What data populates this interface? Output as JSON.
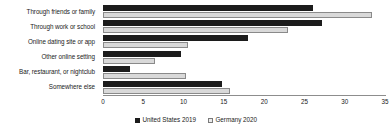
{
  "chart_data": {
    "type": "bar",
    "orientation": "horizontal",
    "title": "",
    "xlabel": "",
    "ylabel": "",
    "xlim": [
      0,
      35
    ],
    "xticks": [
      0,
      5,
      10,
      15,
      20,
      25,
      30,
      35
    ],
    "xtick_labels": [
      "0",
      "5",
      "10",
      "15",
      "20",
      "25",
      "30",
      "35"
    ],
    "grid": false,
    "legend_position": "bottom-center",
    "categories": [
      "Through friends or family",
      "Through work or school",
      "Online dating site or app",
      "Other online setting",
      "Bar, restaurant, or nightclub",
      "Somewhere else"
    ],
    "series": [
      {
        "name": "United States 2019",
        "color": "#1c1c1c",
        "values": [
          26.1,
          27.2,
          18.0,
          9.7,
          3.3,
          14.8
        ]
      },
      {
        "name": "Germany 2020",
        "color": "#d9d9d9",
        "values": [
          33.4,
          22.9,
          10.5,
          6.5,
          10.3,
          15.8
        ]
      }
    ]
  },
  "legend": {
    "entries": [
      {
        "label": "United States 2019",
        "swatch": "filled-black-square"
      },
      {
        "label": "Germany  2020",
        "swatch": "open-light-square"
      }
    ]
  },
  "axis": {
    "x_tick_labels": [
      "0",
      "5",
      "10",
      "15",
      "20",
      "25",
      "30",
      "35"
    ]
  },
  "categories": [
    "Through friends or family",
    "Through work or school",
    "Online dating site or app",
    "Other online setting",
    "Bar, restaurant, or nightclub",
    "Somewhere else"
  ]
}
